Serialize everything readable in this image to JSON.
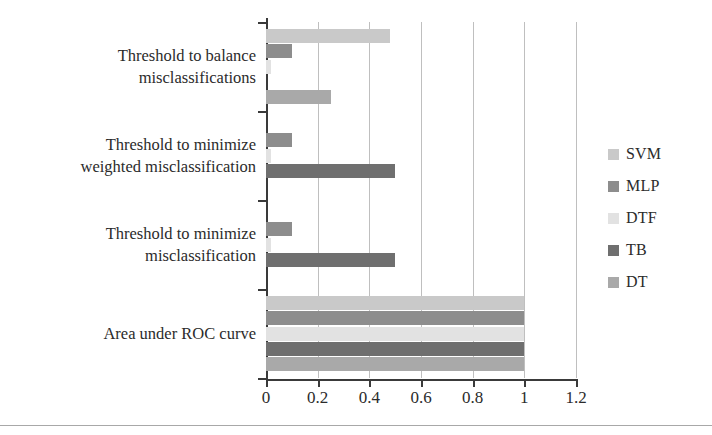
{
  "chart_data": {
    "type": "bar",
    "orientation": "horizontal",
    "title": "",
    "xlabel": "",
    "ylabel": "",
    "xlim": [
      0,
      1.2
    ],
    "xticks": [
      "0",
      "0.2",
      "0.4",
      "0.6",
      "0.8",
      "1",
      "1.2"
    ],
    "xtick_values": [
      0,
      0.2,
      0.4,
      0.6,
      0.8,
      1,
      1.2
    ],
    "grid": true,
    "legend_position": "right",
    "categories": [
      "Threshold to balance misclassifications",
      "Threshold to minimize weighted misclassification",
      "Threshold to minimize misclassification",
      "Area under ROC curve"
    ],
    "category_lines": [
      [
        "Threshold to balance",
        "misclassifications"
      ],
      [
        "Threshold to minimize",
        "weighted misclassification"
      ],
      [
        "Threshold to minimize",
        "misclassification"
      ],
      [
        "Area under ROC curve"
      ]
    ],
    "series": [
      {
        "name": "SVM",
        "color": "#c9c9c9",
        "values": [
          0.48,
          0.0,
          0.0,
          1.0
        ]
      },
      {
        "name": "MLP",
        "color": "#8d8d8d",
        "values": [
          0.1,
          0.1,
          0.1,
          1.0
        ]
      },
      {
        "name": "DTF",
        "color": "#e2e2e2",
        "values": [
          0.02,
          0.02,
          0.02,
          1.0
        ]
      },
      {
        "name": "TB",
        "color": "#6f6f6f",
        "values": [
          0.0,
          0.5,
          0.5,
          1.0
        ]
      },
      {
        "name": "DT",
        "color": "#a9a9a9",
        "values": [
          0.25,
          0.0,
          0.0,
          1.0
        ]
      }
    ]
  },
  "legend": {
    "items": [
      {
        "label": "SVM",
        "color": "#c9c9c9"
      },
      {
        "label": "MLP",
        "color": "#8d8d8d"
      },
      {
        "label": "DTF",
        "color": "#e2e2e2"
      },
      {
        "label": "TB",
        "color": "#6f6f6f"
      },
      {
        "label": "DT",
        "color": "#a9a9a9"
      }
    ]
  },
  "axes": {
    "x_tick_labels": [
      "0",
      "0.2",
      "0.4",
      "0.6",
      "0.8",
      "1",
      "1.2"
    ]
  },
  "colors": {
    "axis": "#3a3a3a",
    "grid": "#bfbfbf",
    "text": "#2b2b2b",
    "background": "#ffffff"
  }
}
